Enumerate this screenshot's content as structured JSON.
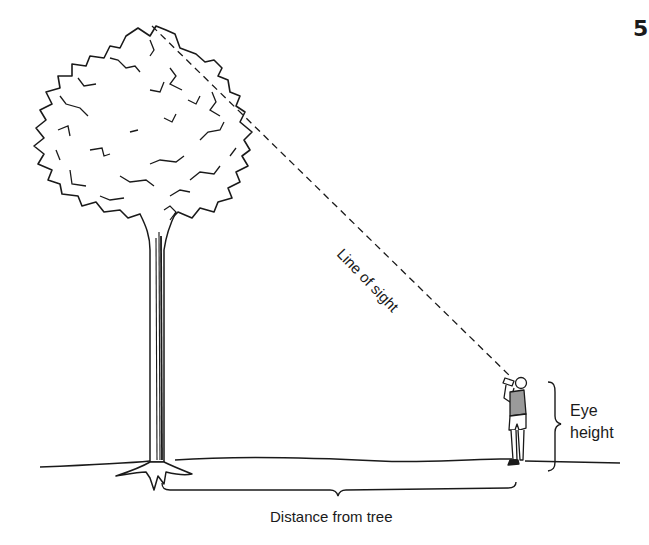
{
  "page": {
    "number": "5"
  },
  "diagram": {
    "labels": {
      "line_of_sight": "Line of sight",
      "eye_height_line1": "Eye",
      "eye_height_line2": "height",
      "distance": "Distance from tree"
    },
    "elements": [
      "tree",
      "person-with-sighting-device",
      "line-of-sight-dashed",
      "eye-height-brace",
      "distance-brace",
      "ground-line"
    ],
    "colors": {
      "ink": "#1a1a1a",
      "shade": "#9a9a9a",
      "background": "#ffffff"
    }
  }
}
